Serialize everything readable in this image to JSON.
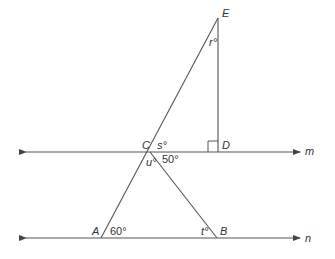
{
  "diagram": {
    "points": {
      "E": "E",
      "C": "C",
      "D": "D",
      "A": "A",
      "B": "B"
    },
    "lines": {
      "m": "m",
      "n": "n"
    },
    "angles": {
      "r": "r°",
      "s": "s°",
      "u": "u°",
      "angle_50": "50°",
      "angle_60": "60°",
      "t": "t°"
    },
    "colors": {
      "line": "#555555",
      "text": "#333333"
    }
  }
}
